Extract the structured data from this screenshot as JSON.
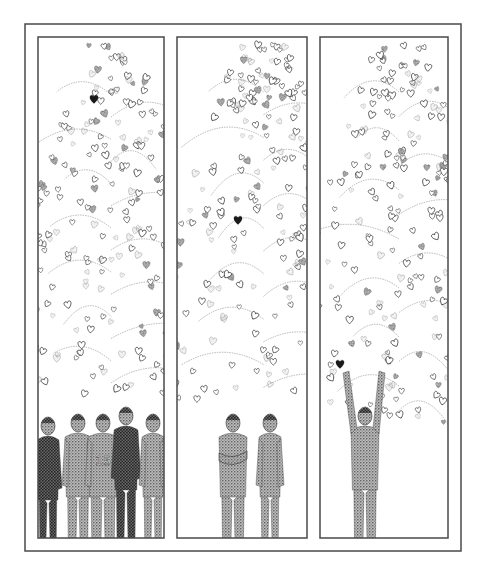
{
  "illustration": {
    "style": "stippled pen-and-ink",
    "colors": {
      "ink": "#2a2a2a",
      "light_ink": "#8a8a8a",
      "paper": "#ffffff",
      "frame": "#4a4a4a",
      "highlight_heart": "#1a1a1a"
    },
    "outer_frame": {
      "x": 25,
      "y": 24,
      "w": 436,
      "h": 527
    },
    "panels": [
      {
        "id": "panel-1",
        "x": 38,
        "y": 37,
        "w": 126,
        "h": 501,
        "foliage": {
          "top": 45,
          "bottom": 395,
          "left_extent": 38,
          "right_extent": 164,
          "seed": 11,
          "count": 230
        },
        "black_heart": {
          "x": 94,
          "y": 99,
          "size": 11
        },
        "figures": [
          {
            "x": 48,
            "w": 22,
            "head_y": 418,
            "pose": "side",
            "shade": 0.75,
            "label": ""
          },
          {
            "x": 78,
            "w": 26,
            "head_y": 415,
            "pose": "front",
            "shade": 0.55,
            "label": ""
          },
          {
            "x": 103,
            "w": 30,
            "head_y": 415,
            "pose": "back",
            "shade": 0.45,
            "label": "15"
          },
          {
            "x": 126,
            "w": 24,
            "head_y": 408,
            "pose": "looking-up",
            "shade": 0.85,
            "label": ""
          },
          {
            "x": 153,
            "w": 22,
            "head_y": 415,
            "pose": "looking-up",
            "shade": 0.5,
            "label": ""
          }
        ]
      },
      {
        "id": "panel-2",
        "x": 177,
        "y": 37,
        "w": 130,
        "h": 501,
        "foliage": {
          "top": 42,
          "bottom": 400,
          "left_extent": 180,
          "right_extent": 307,
          "seed": 23,
          "count": 240
        },
        "black_heart": {
          "x": 238,
          "y": 220,
          "size": 11
        },
        "figures": [
          {
            "x": 233,
            "w": 28,
            "head_y": 415,
            "pose": "arms-crossed",
            "shade": 0.5,
            "label": ""
          },
          {
            "x": 270,
            "w": 22,
            "head_y": 415,
            "pose": "looking-up",
            "shade": 0.45,
            "label": ""
          }
        ]
      },
      {
        "id": "panel-3",
        "x": 320,
        "y": 37,
        "w": 128,
        "h": 501,
        "foliage": {
          "top": 42,
          "bottom": 425,
          "left_extent": 320,
          "right_extent": 448,
          "seed": 37,
          "count": 250
        },
        "black_heart": {
          "x": 340,
          "y": 364,
          "size": 11
        },
        "figures": [
          {
            "x": 365,
            "w": 28,
            "head_y": 408,
            "pose": "arms-raised",
            "shade": 0.55,
            "label": ""
          }
        ]
      }
    ]
  }
}
